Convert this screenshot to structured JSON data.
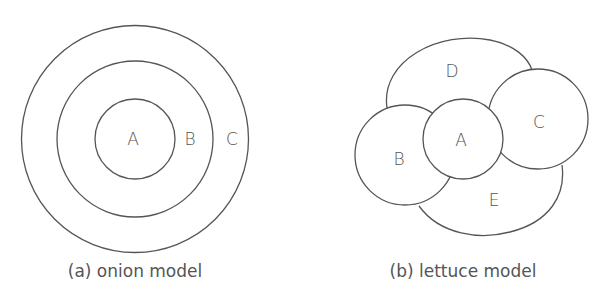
{
  "onion": {
    "labels": {
      "inner": "A",
      "middle": "B",
      "outer": "C"
    },
    "caption": "(a) onion model"
  },
  "lettuce": {
    "labels": {
      "center": "A",
      "left": "B",
      "right": "C",
      "top": "D",
      "bottom": "E"
    },
    "caption": "(b) lettuce model"
  },
  "colors": {
    "stroke": "#555555",
    "text": "#555555",
    "background": "#ffffff"
  }
}
